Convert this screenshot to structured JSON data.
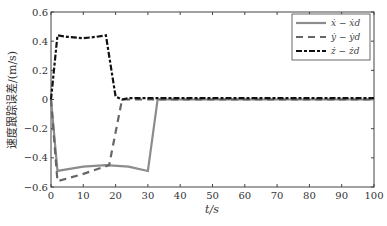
{
  "chart_data": {
    "type": "line",
    "title": "",
    "xlabel": "t/s",
    "ylabel": "速度跟踪误差/(m/s)",
    "xlim": [
      0,
      100
    ],
    "ylim": [
      -0.6,
      0.6
    ],
    "xticks": [
      "0",
      "10",
      "20",
      "30",
      "40",
      "50",
      "60",
      "70",
      "80",
      "90",
      "100"
    ],
    "yticks": [
      "0.6",
      "0.4",
      "0.2",
      "0",
      "-0.2",
      "-0.4",
      "-0.6"
    ],
    "grid": false,
    "legend_position": "upper right",
    "series": [
      {
        "name": "ẋ − ẋd",
        "style": "solid",
        "color": "#8c8c8c",
        "x": [
          0,
          2,
          10,
          17,
          24,
          30,
          33,
          35,
          100
        ],
        "y": [
          0,
          -0.49,
          -0.46,
          -0.45,
          -0.46,
          -0.49,
          0.0,
          0.0,
          0.0
        ]
      },
      {
        "name": "ẏ − ẏd",
        "style": "dashed",
        "color": "#666666",
        "x": [
          0,
          2,
          10,
          18,
          22,
          24,
          100
        ],
        "y": [
          0,
          -0.56,
          -0.51,
          -0.45,
          0.0,
          0.0,
          0.0
        ]
      },
      {
        "name": "ż − żd",
        "style": "dashdot",
        "color": "#111111",
        "x": [
          0,
          2,
          5,
          10,
          14,
          17,
          20,
          22,
          24,
          100
        ],
        "y": [
          0,
          0.44,
          0.43,
          0.42,
          0.43,
          0.44,
          0.02,
          0.0,
          0.01,
          0.01
        ]
      }
    ]
  },
  "legend": {
    "items": [
      "ẋ − ẋd",
      "ẏ − ẏd",
      "ż − żd"
    ]
  },
  "axes": {
    "xlabel": "t/s",
    "ylabel": "速度跟踪误差/(m/s)"
  }
}
